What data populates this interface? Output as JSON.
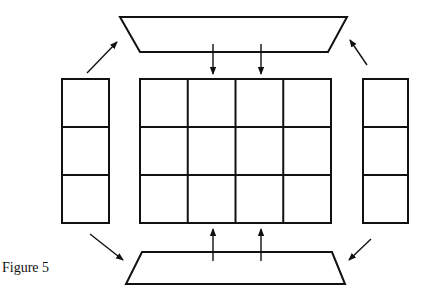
{
  "figure": {
    "caption": "Figure 5",
    "stroke_color": "#111111",
    "background": "#ffffff"
  },
  "shapes": {
    "top_trapezoid": {
      "points": "120,17 347,17 328,52 140,52"
    },
    "bottom_trapezoid": {
      "points": "142,252 332,252 345,284 126,284"
    },
    "left_column": {
      "x": 62,
      "y": 79,
      "width": 47,
      "height": 144,
      "rows": 3
    },
    "right_column": {
      "x": 363,
      "y": 79,
      "width": 45,
      "height": 144,
      "rows": 3
    },
    "center_grid": {
      "x": 140,
      "y": 79,
      "width": 191,
      "height": 144,
      "rows": 3,
      "cols": 4
    }
  },
  "arrows": [
    {
      "name": "arrow-top-trapezoid-to-grid-1",
      "x1": 213,
      "y1": 44,
      "x2": 213,
      "y2": 74
    },
    {
      "name": "arrow-top-trapezoid-to-grid-2",
      "x1": 261,
      "y1": 44,
      "x2": 261,
      "y2": 74
    },
    {
      "name": "arrow-bottom-trapezoid-to-grid-1",
      "x1": 213,
      "y1": 261,
      "x2": 213,
      "y2": 229
    },
    {
      "name": "arrow-bottom-trapezoid-to-grid-2",
      "x1": 261,
      "y1": 261,
      "x2": 261,
      "y2": 229
    },
    {
      "name": "arrow-left-column-to-top",
      "x1": 87,
      "y1": 73,
      "x2": 117,
      "y2": 42
    },
    {
      "name": "arrow-right-column-to-top",
      "x1": 367,
      "y1": 65,
      "x2": 350,
      "y2": 40
    },
    {
      "name": "arrow-left-column-to-bottom",
      "x1": 90,
      "y1": 234,
      "x2": 123,
      "y2": 260
    },
    {
      "name": "arrow-right-column-to-bottom",
      "x1": 371,
      "y1": 239,
      "x2": 349,
      "y2": 260
    }
  ]
}
